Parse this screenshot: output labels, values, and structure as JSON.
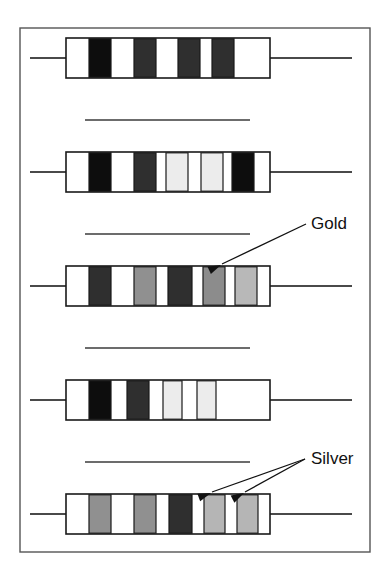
{
  "figure": {
    "canvas": {
      "width": 389,
      "height": 577,
      "background": "#ffffff"
    },
    "frame": {
      "name": "figure-border",
      "x": 20,
      "y": 28,
      "width": 350,
      "height": 524,
      "stroke": "#555555",
      "stroke_width": 1.4,
      "fill": "#ffffff"
    },
    "palette": {
      "black_band": "#0d0d0d",
      "dark_gray_band": "#2f2f2f",
      "mid_gray_band": "#909090",
      "gold_band": "#b8b8b8",
      "silver_band": "#b5b5b5",
      "light_band": "#ececec",
      "body_fill": "#ffffff",
      "outline": "#1a1a1a",
      "lead_wire": "#4a4a4a",
      "divider_line": "#3b3b3b",
      "label_color": "#111111",
      "arrow_color": "#111111"
    },
    "leads": {
      "name": "lead-wire",
      "stroke": "#4a4a4a",
      "stroke_width": 1.8,
      "left_start_x": 30,
      "right_end_x": 352
    },
    "dividers": [
      {
        "name": "divider-line-1",
        "x1": 85,
        "x2": 250,
        "y": 120
      },
      {
        "name": "divider-line-2",
        "x1": 85,
        "x2": 250,
        "y": 234
      },
      {
        "name": "divider-line-3",
        "x1": 85,
        "x2": 250,
        "y": 348
      },
      {
        "name": "divider-line-4",
        "x1": 85,
        "x2": 250,
        "y": 462
      }
    ],
    "resistors": [
      {
        "name": "resistor-1",
        "index": 1,
        "body": {
          "x": 66,
          "y": 38,
          "width": 204,
          "height": 40
        },
        "bands": [
          {
            "name": "band-1",
            "x": 89,
            "width": 22,
            "color": "#0d0d0d"
          },
          {
            "name": "band-2",
            "x": 134,
            "width": 22,
            "color": "#2f2f2f"
          },
          {
            "name": "band-3",
            "x": 178,
            "width": 22,
            "color": "#2f2f2f"
          },
          {
            "name": "band-4",
            "x": 212,
            "width": 22,
            "color": "#2f2f2f"
          }
        ]
      },
      {
        "name": "resistor-2",
        "index": 2,
        "body": {
          "x": 66,
          "y": 152,
          "width": 204,
          "height": 40
        },
        "bands": [
          {
            "name": "band-1",
            "x": 89,
            "width": 22,
            "color": "#0d0d0d"
          },
          {
            "name": "band-2",
            "x": 134,
            "width": 22,
            "color": "#2f2f2f"
          },
          {
            "name": "band-3",
            "x": 166,
            "width": 22,
            "color": "#ececec"
          },
          {
            "name": "band-4",
            "x": 201,
            "width": 22,
            "color": "#ececec"
          },
          {
            "name": "band-5",
            "x": 232,
            "width": 22,
            "color": "#0d0d0d"
          }
        ]
      },
      {
        "name": "resistor-3",
        "index": 3,
        "body": {
          "x": 66,
          "y": 266,
          "width": 204,
          "height": 40
        },
        "bands": [
          {
            "name": "band-1",
            "x": 89,
            "width": 22,
            "color": "#2f2f2f"
          },
          {
            "name": "band-2",
            "x": 134,
            "width": 22,
            "color": "#909090"
          },
          {
            "name": "band-3",
            "x": 168,
            "width": 24,
            "color": "#2f2f2f"
          },
          {
            "name": "band-4",
            "x": 203,
            "width": 22,
            "color": "#8c8c8c"
          },
          {
            "name": "band-5-gold",
            "x": 235,
            "width": 22,
            "color": "#b8b8b8"
          }
        ]
      },
      {
        "name": "resistor-4",
        "index": 4,
        "body": {
          "x": 66,
          "y": 380,
          "width": 204,
          "height": 40
        },
        "bands": [
          {
            "name": "band-1",
            "x": 89,
            "width": 22,
            "color": "#0d0d0d"
          },
          {
            "name": "band-2",
            "x": 127,
            "width": 22,
            "color": "#2f2f2f"
          },
          {
            "name": "band-3",
            "x": 163,
            "width": 19,
            "color": "#ececec"
          },
          {
            "name": "band-4",
            "x": 197,
            "width": 19,
            "color": "#ececec"
          }
        ]
      },
      {
        "name": "resistor-5",
        "index": 5,
        "body": {
          "x": 66,
          "y": 494,
          "width": 204,
          "height": 40
        },
        "bands": [
          {
            "name": "band-1",
            "x": 89,
            "width": 22,
            "color": "#909090"
          },
          {
            "name": "band-2",
            "x": 134,
            "width": 22,
            "color": "#909090"
          },
          {
            "name": "band-3",
            "x": 169,
            "width": 23,
            "color": "#2f2f2f"
          },
          {
            "name": "band-4-silver",
            "x": 204,
            "width": 21,
            "color": "#b5b5b5"
          },
          {
            "name": "band-5-silver",
            "x": 237,
            "width": 21,
            "color": "#b5b5b5"
          }
        ]
      }
    ],
    "annotations": [
      {
        "name": "gold-annotation",
        "label": "Gold",
        "text_x": 311,
        "text_y": 229,
        "anchor": "start",
        "leaders": [
          {
            "name": "gold-leader-line",
            "x1": 306,
            "y1": 224,
            "x2": 222,
            "y2": 264
          }
        ],
        "arrowheads": [
          {
            "name": "gold-arrowhead",
            "x": 221,
            "y": 265,
            "angle": 155
          }
        ]
      },
      {
        "name": "silver-annotation",
        "label": "Silver",
        "text_x": 311,
        "text_y": 464,
        "anchor": "start",
        "leaders": [
          {
            "name": "silver-leader-line-1",
            "x1": 305,
            "y1": 459,
            "x2": 212,
            "y2": 492
          },
          {
            "name": "silver-leader-line-2",
            "x1": 305,
            "y1": 459,
            "x2": 245,
            "y2": 492
          }
        ],
        "arrowheads": [
          {
            "name": "silver-arrowhead-1",
            "x": 211,
            "y": 493,
            "angle": 160
          },
          {
            "name": "silver-arrowhead-2",
            "x": 244,
            "y": 493,
            "angle": 152
          }
        ]
      }
    ]
  }
}
